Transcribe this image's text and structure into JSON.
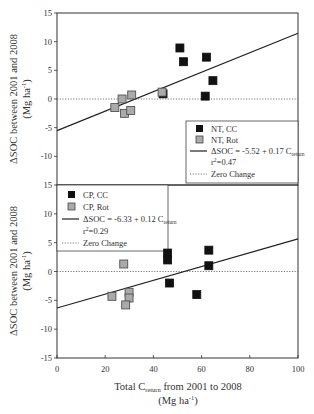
{
  "chart_data": [
    {
      "type": "scatter",
      "panel": "top",
      "ylabel": "ΔSOC between 2001 and 2008 (Mg ha⁻¹)",
      "xlabel": "Total C_return from 2001 to 2008 (Mg ha⁻¹)",
      "xlim": [
        0,
        100
      ],
      "ylim": [
        -15,
        15
      ],
      "xticks": [
        0,
        20,
        40,
        60,
        80,
        100
      ],
      "yticks": [
        -15,
        -10,
        -5,
        0,
        5,
        10,
        15
      ],
      "grid": false,
      "legend_position": "lower right",
      "series": [
        {
          "name": "NT, CC",
          "marker": "square",
          "color": "#111111",
          "points": [
            [
              51,
              8.9
            ],
            [
              52.5,
              6.5
            ],
            [
              62,
              7.3
            ],
            [
              64.7,
              3.2
            ],
            [
              61.5,
              0.5
            ],
            [
              44,
              0.9
            ]
          ]
        },
        {
          "name": "NT, Rot",
          "marker": "square",
          "color": "#aaaaaa",
          "points": [
            [
              24,
              -1.5
            ],
            [
              27,
              0.0
            ],
            [
              31,
              0.7
            ],
            [
              28,
              -2.5
            ],
            [
              30.6,
              -2.0
            ],
            [
              43.6,
              1.2
            ]
          ]
        }
      ],
      "regression": {
        "label": "ΔSOC = -5.52 + 0.17 C_return",
        "intercept": -5.52,
        "slope": 0.17,
        "r2_label": "r² =0.47"
      },
      "reference_line": {
        "label": "Zero Change",
        "y": 0,
        "style": "dotted"
      }
    },
    {
      "type": "scatter",
      "panel": "bottom",
      "ylabel": "ΔSOC between 2001 and 2008 (Mg ha⁻¹)",
      "xlabel": "Total C_return from 2001 to 2008 (Mg ha⁻¹)",
      "xlim": [
        0,
        100
      ],
      "ylim": [
        -15,
        15
      ],
      "xticks": [
        0,
        20,
        40,
        60,
        80,
        100
      ],
      "yticks": [
        -15,
        -10,
        -5,
        0,
        5,
        10,
        15
      ],
      "grid": false,
      "legend_position": "upper left",
      "series": [
        {
          "name": "CP, CC",
          "marker": "square",
          "color": "#111111",
          "points": [
            [
              45.9,
              3.2
            ],
            [
              45.9,
              2.0
            ],
            [
              63,
              3.7
            ],
            [
              63,
              1.0
            ],
            [
              46.7,
              -2.0
            ],
            [
              58,
              -4.0
            ]
          ]
        },
        {
          "name": "CP, Rot",
          "marker": "square",
          "color": "#aaaaaa",
          "points": [
            [
              27.7,
              1.3
            ],
            [
              22.8,
              -4.3
            ],
            [
              29.9,
              -3.6
            ],
            [
              29.9,
              -4.6
            ],
            [
              28.5,
              -5.8
            ]
          ]
        }
      ],
      "regression": {
        "label": "ΔSOC = -6.33 + 0.12 C_return",
        "intercept": -6.33,
        "slope": 0.12,
        "r2_label": "r² =0.29"
      },
      "reference_line": {
        "label": "Zero Change",
        "y": 0,
        "style": "dotted"
      }
    }
  ],
  "labels": {
    "ylabel_line1": "ΔSOC between 2001 and 2008",
    "ylabel_line2": "(Mg ha",
    "ylabel_sup": "-1",
    "ylabel_close": ")",
    "xlabel_pre": "Total C",
    "xlabel_sub": "return",
    "xlabel_post": " from 2001 to 2008",
    "xlabel_line2": "(Mg ha",
    "xlabel_sup": "-1",
    "xlabel_close": ")"
  },
  "legend_top": {
    "item1": "NT, CC",
    "item2": "NT, Rot",
    "eq_pre": "ΔSOC = -5.52 + 0.17 C",
    "eq_sub": "return",
    "r2_pre": "r",
    "r2_sup": "2",
    "r2_post": "=0.47",
    "zero": "Zero Change"
  },
  "legend_bottom": {
    "item1": "CP, CC",
    "item2": "CP, Rot",
    "eq_pre": "ΔSOC = -6.33 + 0.12 C",
    "eq_sub": "return",
    "r2_pre": "r",
    "r2_sup": "2",
    "r2_post": "=0.29",
    "zero": "Zero Change"
  },
  "colors": {
    "axis": "#333333",
    "cc_fill": "#111111",
    "rot_fill": "#aaaaaa",
    "rot_stroke": "#444444"
  }
}
